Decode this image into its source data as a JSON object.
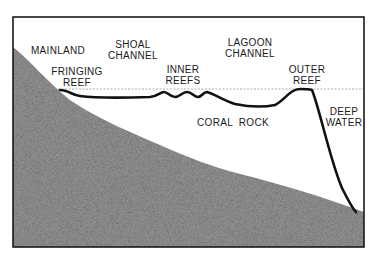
{
  "diagram": {
    "colors": {
      "frame": "#1a1a1a",
      "mainland_fill": "#8f8f8f",
      "reef_line": "#111111",
      "water_line": "#9a9a9a",
      "background": "#ffffff"
    },
    "labels": {
      "mainland": {
        "line1": "MAINLAND"
      },
      "fringing_reef": {
        "line1": "FRINGING",
        "line2": "REEF"
      },
      "shoal_channel": {
        "line1": "SHOAL",
        "line2": "CHANNEL"
      },
      "inner_reefs": {
        "line1": "INNER",
        "line2": "REEFS"
      },
      "lagoon_channel": {
        "line1": "LAGOON",
        "line2": "CHANNEL"
      },
      "outer_reef": {
        "line1": "OUTER",
        "line2": "REEF"
      },
      "coral_rock": {
        "line1": "CORAL  ROCK"
      },
      "deep_water": {
        "line1": "DEEP",
        "line2": "WATER"
      }
    }
  }
}
